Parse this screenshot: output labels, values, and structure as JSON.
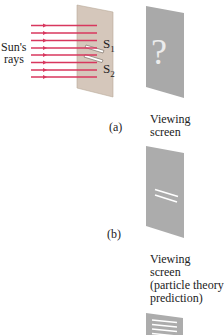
{
  "figure": {
    "source_label": "Sun's",
    "source_label_2": "rays",
    "slit_labels": {
      "s1": "S",
      "s1_sub": "1",
      "s2": "S",
      "s2_sub": "2"
    },
    "panel_a": {
      "tag": "(a)",
      "screen_label_1": "Viewing",
      "screen_label_2": "screen",
      "screen_symbol": "?"
    },
    "panel_b": {
      "tag": "(b)",
      "screen_label_1": "Viewing",
      "screen_label_2": "screen",
      "screen_label_3": "(particle theory",
      "screen_label_4": "prediction)"
    },
    "colors": {
      "ray": "#d8375e",
      "barrier": "#d5c7bb",
      "screen": "#a9a9a9",
      "fringe": "#ffffff"
    }
  }
}
